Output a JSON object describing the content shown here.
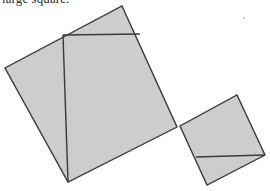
{
  "page": {
    "width": 270,
    "height": 191,
    "background_color": "#ffffff",
    "caption_partial_text": "large square."
  },
  "figure": {
    "fill_color": "#cdcdcd",
    "stroke_color": "#3a3a3a",
    "stroke_width": 1.4,
    "shapes": [
      {
        "name": "large-square",
        "label": "large square",
        "points": "122,6 177,127 68,182 5,68",
        "fill": "#cdcdcd"
      },
      {
        "name": "small-square",
        "label": "small square",
        "points": "237,95 265,155 207,185 180,126",
        "fill": "#cdcdcd"
      }
    ],
    "construction_lines": [
      {
        "name": "large-square-horizontal-chord",
        "x1": 63,
        "y1": 35,
        "x2": 140,
        "y2": 34
      },
      {
        "name": "large-square-vertical-chord",
        "x1": 63,
        "y1": 35,
        "x2": 68,
        "y2": 182
      },
      {
        "name": "small-square-horizontal-chord",
        "x1": 196,
        "y1": 157,
        "x2": 265,
        "y2": 155
      }
    ],
    "speckles": [
      {
        "name": "speckle-upper-right",
        "x": 243,
        "y": 17
      },
      {
        "name": "speckle-mid-lower",
        "x": 131,
        "y": 150
      },
      {
        "name": "speckle-right-edge",
        "x": 254,
        "y": 152
      }
    ]
  },
  "chart_data": {
    "type": "diagram",
    "elements": [
      {
        "name": "large square",
        "vertices": [
          [
            122,
            6
          ],
          [
            177,
            127
          ],
          [
            68,
            182
          ],
          [
            5,
            68
          ]
        ],
        "approx_side_length": 133
      },
      {
        "name": "small square",
        "vertices": [
          [
            237,
            95
          ],
          [
            265,
            155
          ],
          [
            207,
            185
          ],
          [
            180,
            126
          ]
        ],
        "approx_side_length": 66
      }
    ],
    "annotations": [
      "large square."
    ]
  }
}
